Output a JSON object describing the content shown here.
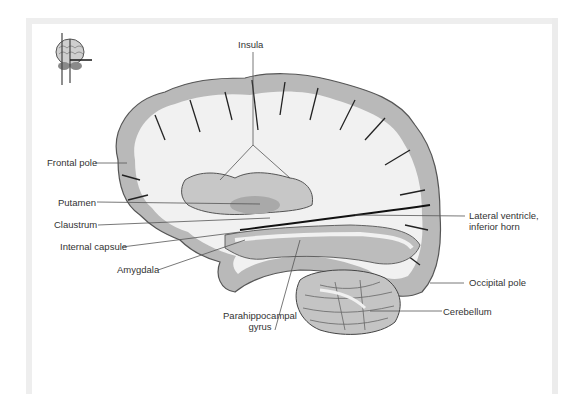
{
  "figure": {
    "colors": {
      "background": "#ffffff",
      "frame": "#eeeeee",
      "gray_matter": "#b9b9b9",
      "white_matter": "#f1f1f1",
      "sulcus_line": "#222222",
      "leader_line": "#555555",
      "label_text": "#333333"
    },
    "orientation_icon": "brain-orientation-thumbnail-icon",
    "labels": {
      "insula": "Insula",
      "frontal_pole": "Frontal pole",
      "putamen": "Putamen",
      "claustrum": "Claustrum",
      "internal_capsule": "Internal capsule",
      "amygdala": "Amygdala",
      "parahippocampal_gyrus_line1": "Parahippocampal",
      "parahippocampal_gyrus_line2": "gyrus",
      "lateral_ventricle_line1": "Lateral ventricle,",
      "lateral_ventricle_line2": "inferior horn",
      "occipital_pole": "Occipital pole",
      "cerebellum": "Cerebellum"
    }
  }
}
